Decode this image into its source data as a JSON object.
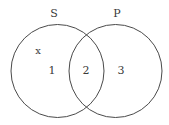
{
  "diagram": {
    "type": "venn",
    "stroke_color": "#4a4a4a",
    "sets": [
      {
        "id": "S",
        "label": "S"
      },
      {
        "id": "P",
        "label": "P"
      }
    ],
    "regions": [
      {
        "id": "1",
        "label": "1",
        "description": "S only"
      },
      {
        "id": "2",
        "label": "2",
        "description": "S and P"
      },
      {
        "id": "3",
        "label": "3",
        "description": "P only"
      }
    ],
    "marks": [
      {
        "label": "x",
        "region": "1"
      }
    ]
  }
}
